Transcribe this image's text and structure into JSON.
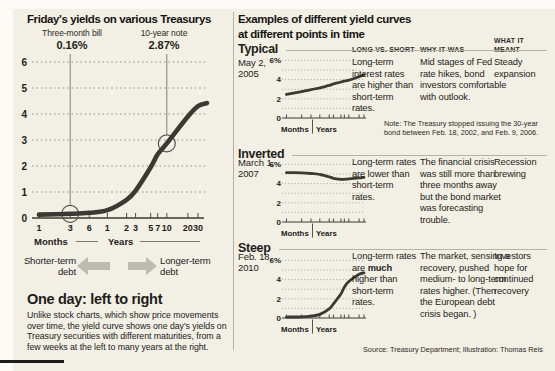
{
  "left": {
    "title": "Friday's yields on various Treasurys",
    "shorter_label": "Shorter-term debt",
    "longer_label": "Longer-term debt",
    "explainer_title": "One day: left to right",
    "explainer_body": "Unlike stock charts, which show price movements over time, the yield curve shows one day's yields on Treasury securities with different maturities, from a few weeks at the left to many years at the right."
  },
  "right": {
    "title_line1": "Examples of different yield curves",
    "title_line2": "at different points in time",
    "columns": [
      "LONG VS. SHORT",
      "WHY IT WAS",
      "WHAT IT MEANT"
    ],
    "rows": [
      {
        "heading": "Typical",
        "date": "May 2, 2005",
        "long_vs_short": {
          "pre": "Long-term interest rates are higher than short-term rates.",
          "bold": "",
          "post": ""
        },
        "why_it_was": "Mid stages of Fed rate hikes, bond investors comfortable with outlook.",
        "what_it_meant": "Steady expansion"
      },
      {
        "heading": "Inverted",
        "date": "March 1, 2007",
        "long_vs_short": {
          "pre": "Long-term rates are lower than short-term rates.",
          "bold": "",
          "post": ""
        },
        "why_it_was": "The financial crisis was still more than three months away but the bond market was forecasting trouble.",
        "what_it_meant": "Recession brewing"
      },
      {
        "heading": "Steep",
        "date": "Feb. 18, 2010",
        "long_vs_short": {
          "pre": "Long-term rates are ",
          "bold": "much",
          "post": " higher than short-term rates."
        },
        "why_it_was": "The market, sensing a recovery, pushed medium- to long-term rates higher. (Then the European debt crisis began. )",
        "what_it_meant": "Investors hope for continued recovery"
      }
    ],
    "note": "Note: The Treasury stopped issuing the 30-year bond between Feb. 18, 2002, and Feb. 9, 2006.",
    "source": "Source: Treasury Department; Illustration: Thomas Reis"
  },
  "chart_data": [
    {
      "id": "friday",
      "type": "line",
      "title": "Friday's yields on various Treasurys",
      "categories": [
        "1 mo",
        "3 mo",
        "6 mo",
        "1 yr",
        "2 yr",
        "3 yr",
        "5 yr",
        "7 yr",
        "10 yr",
        "20 yr",
        "30 yr"
      ],
      "values": [
        0.13,
        0.16,
        0.2,
        0.3,
        0.7,
        1.05,
        1.95,
        2.45,
        2.87,
        3.9,
        4.3
      ],
      "ylim": [
        0,
        6
      ],
      "ylabel": "%",
      "grid": "dotted horizontal",
      "y_tick_labels": [
        "6",
        "5",
        "4",
        "3",
        "2",
        "1",
        "0"
      ],
      "tick_labels": [
        "1",
        "3",
        "6",
        "1",
        "2",
        "3",
        "5",
        "7",
        "10",
        "20",
        "30"
      ],
      "x_group_labels": [
        "Months",
        "Years"
      ],
      "callouts": [
        {
          "index": 1,
          "label": "Three-month bill",
          "value": "0.16%"
        },
        {
          "index": 8,
          "label": "10-year note",
          "value": "2.87%"
        }
      ]
    },
    {
      "id": "typical",
      "type": "line",
      "title": "Typical",
      "date": "May 2, 2005",
      "categories": [
        "1 mo",
        "3 mo",
        "6 mo",
        "1 yr",
        "2 yr",
        "3 yr",
        "5 yr",
        "7 yr",
        "10 yr",
        "20 yr",
        "30 yr"
      ],
      "values": [
        2.45,
        2.75,
        2.95,
        3.15,
        3.4,
        3.55,
        3.75,
        3.85,
        3.95,
        4.3,
        4.5
      ],
      "ylim": [
        0,
        6
      ],
      "grid": "dotted horizontal",
      "y_tick_labels": [
        "6%",
        "4",
        "2",
        "0"
      ],
      "x_group_labels": [
        "Months",
        "Years"
      ]
    },
    {
      "id": "inverted",
      "type": "line",
      "title": "Inverted",
      "date": "March 1, 2007",
      "categories": [
        "1 mo",
        "3 mo",
        "6 mo",
        "1 yr",
        "2 yr",
        "3 yr",
        "5 yr",
        "7 yr",
        "10 yr",
        "20 yr",
        "30 yr"
      ],
      "values": [
        5.15,
        5.12,
        5.05,
        4.95,
        4.7,
        4.55,
        4.45,
        4.45,
        4.5,
        4.6,
        4.65
      ],
      "ylim": [
        0,
        6
      ],
      "grid": "dotted horizontal",
      "y_tick_labels": [
        "6%",
        "4",
        "2",
        "0"
      ],
      "x_group_labels": [
        "Months",
        "Years"
      ]
    },
    {
      "id": "steep",
      "type": "line",
      "title": "Steep",
      "date": "Feb. 18, 2010",
      "categories": [
        "1 mo",
        "3 mo",
        "6 mo",
        "1 yr",
        "2 yr",
        "3 yr",
        "5 yr",
        "7 yr",
        "10 yr",
        "20 yr",
        "30 yr"
      ],
      "values": [
        0.1,
        0.12,
        0.2,
        0.38,
        0.95,
        1.5,
        2.5,
        3.2,
        3.8,
        4.55,
        4.7
      ],
      "ylim": [
        0,
        6
      ],
      "grid": "dotted horizontal",
      "y_tick_labels": [
        "6%",
        "4",
        "2",
        "0"
      ],
      "x_group_labels": [
        "Months",
        "Years"
      ]
    }
  ]
}
